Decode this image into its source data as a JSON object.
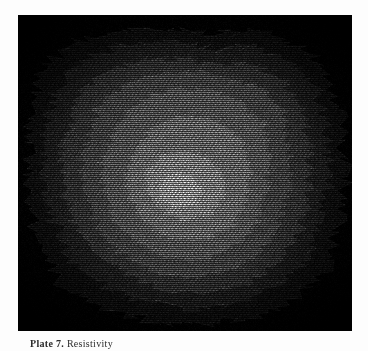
{
  "page": {
    "background_color": "#fdfdfd",
    "kind": "printed-plate-figure"
  },
  "plate": {
    "panel_background": "#000000",
    "panel_left": 18,
    "panel_top": 15,
    "panel_width": 334,
    "panel_height": 316,
    "rendering": "dithered raster contour shading",
    "hatching": "zigzag / herringbone chevron dither"
  },
  "caption": {
    "label": "Plate 7.",
    "text": "Resistivity",
    "full": "Plate 7.  Resistivity"
  },
  "chart_data": {
    "type": "heatmap",
    "title": "Plate 7.  Resistivity",
    "subtitle": "",
    "xlabel": "",
    "ylabel": "",
    "grid": false,
    "legend_position": "none",
    "colormap": "grayscale",
    "level_labels": [
      "L1",
      "L2",
      "L3",
      "L4",
      "L5",
      "L6",
      "L7",
      "L8"
    ],
    "level_colors": [
      "#000000",
      "#1a1a1a",
      "#2e2e2e",
      "#454545",
      "#5e5e5e",
      "#7a7a7a",
      "#9c9c9c",
      "#c6c6c6"
    ],
    "level_values": [
      0,
      1,
      2,
      3,
      4,
      5,
      6,
      7
    ],
    "contours": [
      {
        "level": 1,
        "value": 1,
        "color": "#1c1c1c",
        "points": [
          [
            0.04,
            0.3
          ],
          [
            0.08,
            0.16
          ],
          [
            0.17,
            0.09
          ],
          [
            0.3,
            0.05
          ],
          [
            0.45,
            0.04
          ],
          [
            0.6,
            0.06
          ],
          [
            0.72,
            0.05
          ],
          [
            0.84,
            0.1
          ],
          [
            0.93,
            0.18
          ],
          [
            0.97,
            0.33
          ],
          [
            0.98,
            0.5
          ],
          [
            0.96,
            0.66
          ],
          [
            0.92,
            0.8
          ],
          [
            0.83,
            0.9
          ],
          [
            0.7,
            0.96
          ],
          [
            0.55,
            0.98
          ],
          [
            0.4,
            0.97
          ],
          [
            0.26,
            0.93
          ],
          [
            0.14,
            0.86
          ],
          [
            0.06,
            0.72
          ],
          [
            0.03,
            0.55
          ],
          [
            0.03,
            0.42
          ]
        ]
      },
      {
        "level": 2,
        "value": 2,
        "color": "#2f2f2f",
        "points": [
          [
            0.09,
            0.33
          ],
          [
            0.13,
            0.2
          ],
          [
            0.22,
            0.13
          ],
          [
            0.34,
            0.09
          ],
          [
            0.47,
            0.09
          ],
          [
            0.6,
            0.11
          ],
          [
            0.71,
            0.1
          ],
          [
            0.81,
            0.15
          ],
          [
            0.89,
            0.23
          ],
          [
            0.92,
            0.36
          ],
          [
            0.93,
            0.51
          ],
          [
            0.9,
            0.65
          ],
          [
            0.86,
            0.77
          ],
          [
            0.77,
            0.86
          ],
          [
            0.65,
            0.91
          ],
          [
            0.52,
            0.93
          ],
          [
            0.39,
            0.91
          ],
          [
            0.27,
            0.87
          ],
          [
            0.17,
            0.79
          ],
          [
            0.11,
            0.67
          ],
          [
            0.08,
            0.53
          ],
          [
            0.08,
            0.42
          ]
        ]
      },
      {
        "level": 3,
        "value": 3,
        "color": "#454545",
        "points": [
          [
            0.15,
            0.36
          ],
          [
            0.19,
            0.24
          ],
          [
            0.27,
            0.18
          ],
          [
            0.38,
            0.14
          ],
          [
            0.5,
            0.14
          ],
          [
            0.61,
            0.16
          ],
          [
            0.71,
            0.16
          ],
          [
            0.79,
            0.21
          ],
          [
            0.85,
            0.3
          ],
          [
            0.87,
            0.42
          ],
          [
            0.87,
            0.55
          ],
          [
            0.84,
            0.68
          ],
          [
            0.78,
            0.78
          ],
          [
            0.68,
            0.85
          ],
          [
            0.57,
            0.88
          ],
          [
            0.45,
            0.87
          ],
          [
            0.34,
            0.83
          ],
          [
            0.24,
            0.76
          ],
          [
            0.17,
            0.66
          ],
          [
            0.14,
            0.54
          ],
          [
            0.13,
            0.44
          ]
        ]
      },
      {
        "level": 4,
        "value": 4,
        "color": "#5c5c5c",
        "points": [
          [
            0.21,
            0.39
          ],
          [
            0.25,
            0.28
          ],
          [
            0.33,
            0.22
          ],
          [
            0.43,
            0.18
          ],
          [
            0.54,
            0.18
          ],
          [
            0.64,
            0.21
          ],
          [
            0.73,
            0.23
          ],
          [
            0.79,
            0.31
          ],
          [
            0.81,
            0.42
          ],
          [
            0.81,
            0.55
          ],
          [
            0.78,
            0.67
          ],
          [
            0.72,
            0.76
          ],
          [
            0.63,
            0.81
          ],
          [
            0.52,
            0.83
          ],
          [
            0.41,
            0.81
          ],
          [
            0.31,
            0.76
          ],
          [
            0.24,
            0.68
          ],
          [
            0.2,
            0.57
          ],
          [
            0.19,
            0.47
          ]
        ]
      },
      {
        "level": 5,
        "value": 5,
        "color": "#767676",
        "points": [
          [
            0.27,
            0.42
          ],
          [
            0.31,
            0.32
          ],
          [
            0.39,
            0.26
          ],
          [
            0.48,
            0.23
          ],
          [
            0.58,
            0.24
          ],
          [
            0.67,
            0.28
          ],
          [
            0.73,
            0.35
          ],
          [
            0.75,
            0.45
          ],
          [
            0.74,
            0.56
          ],
          [
            0.71,
            0.66
          ],
          [
            0.65,
            0.73
          ],
          [
            0.56,
            0.77
          ],
          [
            0.46,
            0.77
          ],
          [
            0.37,
            0.73
          ],
          [
            0.3,
            0.66
          ],
          [
            0.26,
            0.56
          ],
          [
            0.25,
            0.48
          ]
        ]
      },
      {
        "level": 6,
        "value": 6,
        "color": "#949494",
        "points": [
          [
            0.34,
            0.46
          ],
          [
            0.38,
            0.38
          ],
          [
            0.45,
            0.33
          ],
          [
            0.54,
            0.32
          ],
          [
            0.62,
            0.35
          ],
          [
            0.68,
            0.41
          ],
          [
            0.69,
            0.5
          ],
          [
            0.68,
            0.59
          ],
          [
            0.64,
            0.67
          ],
          [
            0.56,
            0.71
          ],
          [
            0.47,
            0.71
          ],
          [
            0.39,
            0.67
          ],
          [
            0.34,
            0.59
          ],
          [
            0.32,
            0.52
          ]
        ]
      },
      {
        "level": 7,
        "value": 7,
        "color": "#b4b4b4",
        "points": [
          [
            0.38,
            0.51
          ],
          [
            0.42,
            0.45
          ],
          [
            0.49,
            0.43
          ],
          [
            0.56,
            0.45
          ],
          [
            0.61,
            0.5
          ],
          [
            0.62,
            0.57
          ],
          [
            0.58,
            0.63
          ],
          [
            0.5,
            0.65
          ],
          [
            0.43,
            0.62
          ],
          [
            0.39,
            0.57
          ]
        ]
      },
      {
        "level": 8,
        "value": 8,
        "color": "#d2d2d2",
        "points": [
          [
            0.42,
            0.54
          ],
          [
            0.46,
            0.5
          ],
          [
            0.52,
            0.51
          ],
          [
            0.55,
            0.55
          ],
          [
            0.53,
            0.6
          ],
          [
            0.47,
            0.61
          ],
          [
            0.43,
            0.58
          ]
        ]
      }
    ]
  }
}
